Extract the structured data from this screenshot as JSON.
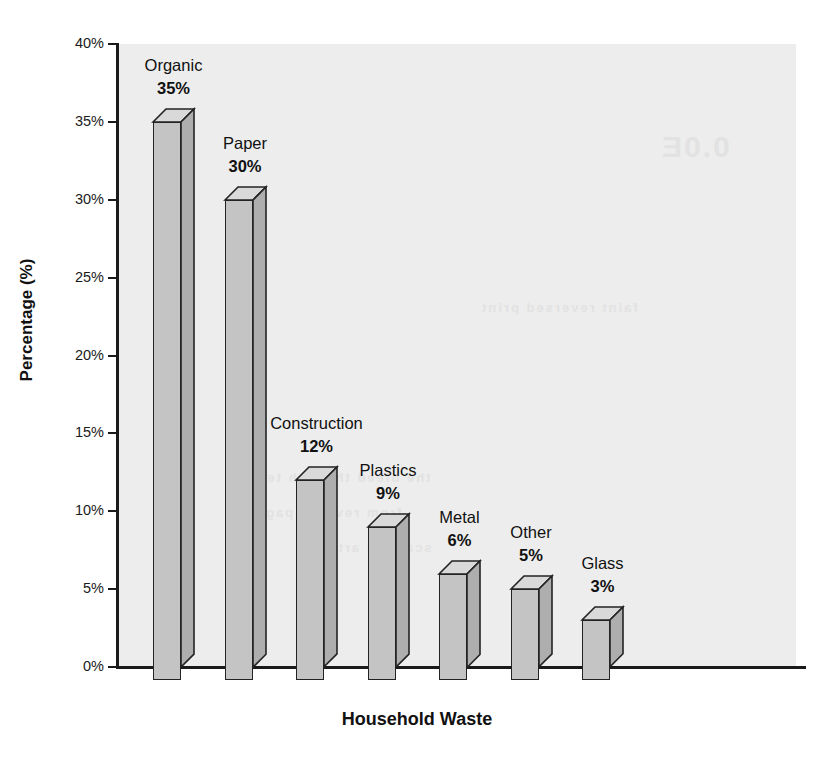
{
  "chart_data": {
    "type": "bar",
    "title": "",
    "xlabel": "Household Waste",
    "ylabel": "Percentage (%)",
    "categories": [
      "Organic",
      "Paper",
      "Construction",
      "Plastics",
      "Metal",
      "Other",
      "Glass"
    ],
    "values": [
      35,
      30,
      12,
      9,
      6,
      5,
      3
    ],
    "value_labels": [
      "35%",
      "30%",
      "12%",
      "9%",
      "6%",
      "5%",
      "3%"
    ],
    "ylim": [
      0,
      40
    ],
    "ytick_values": [
      0,
      5,
      10,
      15,
      20,
      25,
      30,
      35,
      40
    ],
    "ytick_labels": [
      "0%",
      "5%",
      "10%",
      "15%",
      "20%",
      "25%",
      "30%",
      "35%",
      "40%"
    ],
    "grid": false,
    "legend": false,
    "style": "3d-column",
    "colors": {
      "bar_front": "#c4c4c4",
      "bar_top": "#d9d9d9",
      "bar_side": "#aeaeae",
      "bar_edge": "#232323",
      "plot_background": "#ededed",
      "axis": "#1a1a1a",
      "text": "#111111"
    }
  },
  "ghost_text": {
    "g1": "0.0E",
    "g2": "the bleed through text",
    "g3": "from reverse page",
    "g4": "scanned artifact",
    "g5": "faint reversed print"
  }
}
